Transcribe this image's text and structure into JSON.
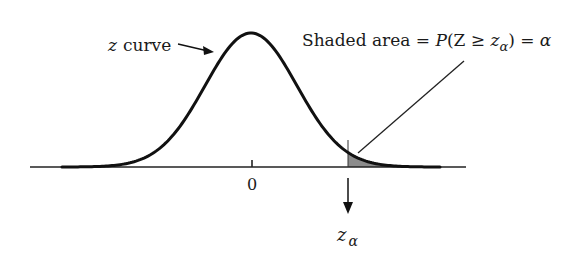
{
  "figure": {
    "curve_label_var": "z",
    "curve_label_word": "curve",
    "shaded_text_prefix": "Shaded area = ",
    "shaded_P": "P",
    "shaded_open": "(Z ≥ ",
    "shaded_z": "z",
    "shaded_sub": "α",
    "shaded_close": ") = ",
    "shaded_alpha": "α",
    "tick_zero": "0",
    "critical_var": "z",
    "critical_sub": "α"
  },
  "colors": {
    "curve": "#111111",
    "shade": "#8c8c8c",
    "axis": "#222222"
  }
}
